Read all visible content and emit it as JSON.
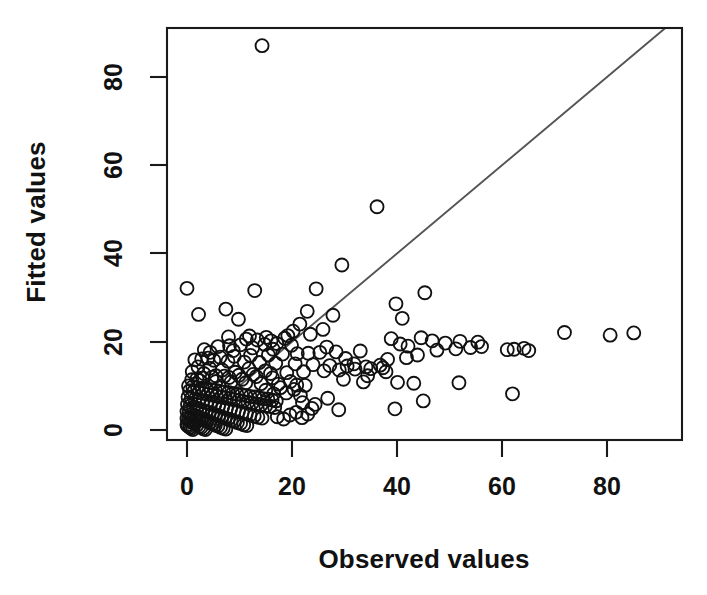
{
  "figure": {
    "background_color": "#ffffff",
    "foreground_color": "#111111",
    "reference_line_color": "#555555",
    "point_stroke_color": "#111111"
  },
  "labels": {
    "xlabel": "Observed values",
    "ylabel": "Fitted values",
    "x_ticks": [
      "0",
      "20",
      "40",
      "60",
      "80"
    ],
    "y_ticks": [
      "0",
      "20",
      "40",
      "60",
      "80"
    ]
  },
  "chart_data": {
    "type": "scatter",
    "title": "",
    "xlabel": "Observed values",
    "ylabel": "Fitted values",
    "xlim": [
      -3.8,
      94.3
    ],
    "ylim": [
      -2.3,
      90.9
    ],
    "xticks": [
      0,
      20,
      40,
      60,
      80
    ],
    "yticks": [
      0,
      20,
      40,
      60,
      80
    ],
    "grid": false,
    "legend": null,
    "marker": "open-circle",
    "marker_size_px": 13,
    "annotations": [
      {
        "kind": "reference-line",
        "description": "1:1 identity line through the origin",
        "x0": 0,
        "y0": 0,
        "x1": 91,
        "y1": 91
      }
    ],
    "series": [
      {
        "name": "observations",
        "points": [
          [
            14.3,
            87.1
          ],
          [
            36.2,
            50.6
          ],
          [
            29.5,
            37.4
          ],
          [
            0.0,
            32.1
          ],
          [
            24.6,
            32.0
          ],
          [
            12.9,
            31.6
          ],
          [
            45.3,
            31.1
          ],
          [
            39.8,
            28.6
          ],
          [
            7.4,
            27.4
          ],
          [
            22.9,
            26.9
          ],
          [
            2.2,
            26.2
          ],
          [
            27.8,
            26.0
          ],
          [
            41.0,
            25.3
          ],
          [
            9.8,
            25.1
          ],
          [
            21.5,
            24.0
          ],
          [
            20.2,
            22.4
          ],
          [
            71.9,
            22.1
          ],
          [
            85.1,
            22.0
          ],
          [
            80.6,
            21.5
          ],
          [
            44.6,
            20.9
          ],
          [
            38.9,
            20.7
          ],
          [
            18.6,
            20.8
          ],
          [
            11.3,
            20.6
          ],
          [
            13.4,
            20.4
          ],
          [
            16.0,
            20.2
          ],
          [
            46.7,
            20.2
          ],
          [
            52.0,
            20.1
          ],
          [
            55.4,
            19.9
          ],
          [
            49.2,
            19.7
          ],
          [
            17.1,
            19.6
          ],
          [
            14.8,
            19.4
          ],
          [
            10.2,
            19.3
          ],
          [
            8.1,
            19.1
          ],
          [
            19.9,
            19.2
          ],
          [
            40.6,
            19.5
          ],
          [
            42.1,
            19.0
          ],
          [
            56.1,
            18.9
          ],
          [
            54.0,
            18.7
          ],
          [
            64.2,
            18.5
          ],
          [
            62.3,
            18.3
          ],
          [
            61.0,
            18.2
          ],
          [
            65.1,
            18.0
          ],
          [
            51.2,
            18.4
          ],
          [
            47.6,
            18.1
          ],
          [
            33.0,
            17.9
          ],
          [
            28.4,
            17.7
          ],
          [
            25.3,
            17.6
          ],
          [
            23.1,
            17.4
          ],
          [
            21.0,
            17.3
          ],
          [
            18.2,
            17.2
          ],
          [
            15.5,
            17.0
          ],
          [
            12.1,
            16.9
          ],
          [
            9.0,
            16.7
          ],
          [
            6.3,
            16.5
          ],
          [
            4.0,
            16.3
          ],
          [
            2.8,
            16.1
          ],
          [
            1.5,
            15.9
          ],
          [
            5.1,
            15.8
          ],
          [
            7.8,
            15.6
          ],
          [
            10.9,
            15.4
          ],
          [
            13.8,
            15.3
          ],
          [
            16.9,
            15.1
          ],
          [
            20.6,
            15.0
          ],
          [
            24.0,
            14.8
          ],
          [
            27.2,
            14.6
          ],
          [
            30.5,
            14.5
          ],
          [
            34.1,
            14.3
          ],
          [
            37.3,
            14.1
          ],
          [
            35.0,
            13.9
          ],
          [
            32.0,
            13.8
          ],
          [
            29.0,
            13.6
          ],
          [
            26.1,
            13.4
          ],
          [
            22.2,
            13.2
          ],
          [
            19.0,
            13.0
          ],
          [
            15.9,
            12.8
          ],
          [
            12.6,
            12.6
          ],
          [
            9.9,
            12.4
          ],
          [
            7.1,
            12.2
          ],
          [
            4.8,
            12.0
          ],
          [
            3.0,
            11.8
          ],
          [
            1.9,
            11.6
          ],
          [
            0.9,
            11.4
          ],
          [
            2.4,
            11.2
          ],
          [
            5.5,
            11.0
          ],
          [
            8.4,
            10.9
          ],
          [
            11.2,
            10.7
          ],
          [
            14.1,
            10.5
          ],
          [
            17.4,
            10.4
          ],
          [
            20.9,
            10.2
          ],
          [
            33.6,
            10.9
          ],
          [
            40.1,
            10.8
          ],
          [
            43.2,
            10.6
          ],
          [
            51.8,
            10.7
          ],
          [
            62.0,
            8.2
          ],
          [
            45.0,
            6.6
          ],
          [
            39.6,
            4.8
          ],
          [
            28.9,
            4.6
          ],
          [
            23.8,
            4.9
          ],
          [
            0.3,
            10.0
          ],
          [
            1.1,
            9.8
          ],
          [
            2.0,
            9.6
          ],
          [
            2.9,
            9.5
          ],
          [
            3.7,
            9.3
          ],
          [
            4.6,
            9.1
          ],
          [
            5.4,
            9.0
          ],
          [
            6.2,
            8.8
          ],
          [
            7.0,
            8.6
          ],
          [
            7.9,
            8.5
          ],
          [
            8.7,
            8.3
          ],
          [
            9.5,
            8.1
          ],
          [
            10.4,
            8.0
          ],
          [
            11.2,
            7.8
          ],
          [
            12.0,
            7.6
          ],
          [
            12.9,
            7.5
          ],
          [
            13.7,
            7.3
          ],
          [
            14.5,
            7.1
          ],
          [
            15.4,
            7.0
          ],
          [
            16.2,
            6.8
          ],
          [
            17.0,
            6.6
          ],
          [
            0.5,
            8.9
          ],
          [
            1.3,
            8.7
          ],
          [
            2.2,
            8.5
          ],
          [
            3.1,
            8.3
          ],
          [
            3.9,
            8.1
          ],
          [
            4.8,
            7.9
          ],
          [
            5.6,
            7.7
          ],
          [
            6.5,
            7.5
          ],
          [
            7.3,
            7.3
          ],
          [
            8.2,
            7.1
          ],
          [
            9.0,
            6.9
          ],
          [
            9.9,
            6.7
          ],
          [
            10.7,
            6.5
          ],
          [
            11.6,
            6.3
          ],
          [
            12.4,
            6.1
          ],
          [
            13.3,
            5.9
          ],
          [
            14.1,
            5.7
          ],
          [
            15.0,
            5.5
          ],
          [
            15.8,
            5.3
          ],
          [
            16.7,
            5.1
          ],
          [
            0.2,
            7.5
          ],
          [
            0.8,
            7.2
          ],
          [
            1.5,
            6.9
          ],
          [
            2.3,
            6.7
          ],
          [
            3.0,
            6.4
          ],
          [
            3.8,
            6.2
          ],
          [
            4.5,
            5.9
          ],
          [
            5.3,
            5.7
          ],
          [
            6.0,
            5.4
          ],
          [
            6.8,
            5.2
          ],
          [
            7.5,
            4.9
          ],
          [
            8.3,
            4.7
          ],
          [
            9.0,
            4.4
          ],
          [
            9.8,
            4.2
          ],
          [
            10.5,
            3.9
          ],
          [
            11.3,
            3.7
          ],
          [
            12.0,
            3.4
          ],
          [
            12.8,
            3.2
          ],
          [
            13.5,
            2.9
          ],
          [
            14.3,
            2.7
          ],
          [
            0.1,
            5.8
          ],
          [
            0.6,
            5.5
          ],
          [
            1.2,
            5.2
          ],
          [
            1.8,
            5.0
          ],
          [
            2.4,
            4.7
          ],
          [
            3.0,
            4.5
          ],
          [
            3.6,
            4.2
          ],
          [
            4.2,
            4.0
          ],
          [
            4.8,
            3.7
          ],
          [
            5.4,
            3.5
          ],
          [
            6.0,
            3.2
          ],
          [
            6.6,
            3.0
          ],
          [
            7.2,
            2.7
          ],
          [
            7.8,
            2.5
          ],
          [
            8.4,
            2.2
          ],
          [
            9.0,
            2.0
          ],
          [
            9.6,
            1.7
          ],
          [
            10.2,
            1.5
          ],
          [
            10.8,
            1.2
          ],
          [
            11.4,
            1.0
          ],
          [
            0.0,
            4.2
          ],
          [
            0.4,
            3.9
          ],
          [
            0.9,
            3.6
          ],
          [
            1.4,
            3.3
          ],
          [
            1.9,
            3.1
          ],
          [
            2.4,
            2.8
          ],
          [
            2.9,
            2.5
          ],
          [
            3.4,
            2.2
          ],
          [
            3.9,
            2.0
          ],
          [
            4.4,
            1.7
          ],
          [
            4.9,
            1.4
          ],
          [
            5.4,
            1.1
          ],
          [
            5.9,
            0.9
          ],
          [
            6.4,
            0.6
          ],
          [
            6.9,
            0.4
          ],
          [
            7.4,
            0.2
          ],
          [
            0.0,
            2.6
          ],
          [
            0.3,
            2.3
          ],
          [
            0.7,
            2.0
          ],
          [
            1.1,
            1.7
          ],
          [
            1.5,
            1.4
          ],
          [
            1.9,
            1.1
          ],
          [
            2.3,
            0.8
          ],
          [
            2.7,
            0.6
          ],
          [
            3.1,
            0.3
          ],
          [
            3.5,
            0.1
          ],
          [
            0.0,
            1.2
          ],
          [
            0.2,
            0.9
          ],
          [
            0.5,
            0.6
          ],
          [
            0.8,
            0.4
          ],
          [
            1.1,
            0.1
          ],
          [
            15.0,
            9.0
          ],
          [
            16.5,
            8.2
          ],
          [
            17.8,
            9.6
          ],
          [
            18.9,
            8.4
          ],
          [
            19.7,
            11.0
          ],
          [
            20.4,
            9.2
          ],
          [
            21.6,
            7.8
          ],
          [
            22.5,
            10.1
          ],
          [
            17.2,
            3.0
          ],
          [
            18.4,
            2.5
          ],
          [
            19.6,
            3.4
          ],
          [
            20.8,
            4.0
          ],
          [
            21.9,
            2.8
          ],
          [
            23.0,
            3.6
          ],
          [
            16.3,
            11.8
          ],
          [
            14.9,
            13.4
          ],
          [
            13.2,
            12.1
          ],
          [
            11.8,
            13.9
          ],
          [
            10.5,
            11.5
          ],
          [
            9.2,
            13.1
          ],
          [
            8.0,
            11.9
          ],
          [
            6.7,
            13.6
          ],
          [
            5.5,
            12.3
          ],
          [
            4.3,
            14.0
          ],
          [
            3.2,
            12.8
          ],
          [
            2.1,
            14.3
          ],
          [
            1.0,
            13.2
          ],
          [
            25.9,
            22.8
          ],
          [
            23.5,
            21.7
          ],
          [
            19.2,
            21.4
          ],
          [
            15.1,
            21.0
          ],
          [
            11.9,
            21.3
          ],
          [
            7.9,
            21.1
          ],
          [
            4.4,
            17.6
          ],
          [
            3.3,
            18.2
          ],
          [
            5.9,
            18.9
          ],
          [
            8.8,
            18.0
          ],
          [
            12.5,
            18.6
          ],
          [
            16.4,
            18.3
          ],
          [
            26.6,
            18.8
          ],
          [
            30.2,
            16.2
          ],
          [
            31.8,
            15.0
          ],
          [
            36.8,
            14.7
          ],
          [
            38.2,
            16.0
          ],
          [
            41.8,
            16.4
          ],
          [
            43.9,
            17.0
          ],
          [
            29.8,
            11.5
          ],
          [
            34.4,
            12.3
          ],
          [
            37.9,
            13.2
          ],
          [
            24.4,
            5.8
          ],
          [
            26.8,
            7.2
          ],
          [
            22.0,
            6.2
          ]
        ]
      }
    ]
  }
}
